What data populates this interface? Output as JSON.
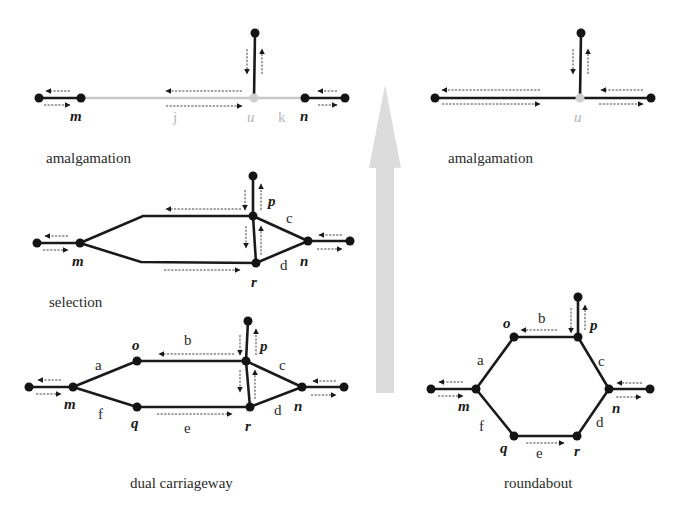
{
  "diagram": {
    "panels": {
      "amalgamation_left": {
        "caption": "amalgamation",
        "node_labels": {
          "m": "m",
          "u": "u",
          "n": "n"
        },
        "edge_labels": {
          "j": "j",
          "k": "k"
        }
      },
      "amalgamation_right": {
        "caption": "amalgamation",
        "node_labels": {
          "u": "u"
        }
      },
      "selection": {
        "caption": "selection",
        "node_labels": {
          "m": "m",
          "p": "p",
          "r": "r",
          "n": "n"
        },
        "edge_labels": {
          "c": "c",
          "d": "d"
        }
      },
      "dual_carriageway": {
        "caption": "dual carriageway",
        "node_labels": {
          "m": "m",
          "o": "o",
          "q": "q",
          "p": "p",
          "r": "r",
          "n": "n"
        },
        "edge_labels": {
          "a": "a",
          "b": "b",
          "c": "c",
          "d": "d",
          "e": "e",
          "f": "f"
        }
      },
      "roundabout": {
        "caption": "roundabout",
        "node_labels": {
          "m": "m",
          "o": "o",
          "q": "q",
          "p": "p",
          "r": "r",
          "n": "n"
        },
        "edge_labels": {
          "a": "a",
          "b": "b",
          "c": "c",
          "d": "d",
          "e": "e",
          "f": "f"
        }
      }
    },
    "central_arrow": {
      "direction": "up",
      "color": "#dcdcdc"
    },
    "colors": {
      "road": "#1a1a1a",
      "ghost": "#c8c8c8",
      "flow": "#444444"
    }
  }
}
